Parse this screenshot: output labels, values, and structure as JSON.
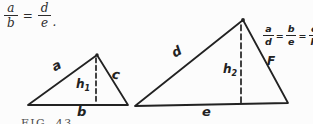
{
  "colors": {
    "ink": "#222222",
    "paper": "#fcfcfc"
  },
  "printed_equation": {
    "num1": "a",
    "den1": "b",
    "eq": "=",
    "num2": "d",
    "den2": "e",
    "period": "."
  },
  "handwritten_equation": {
    "num1": "a",
    "den1": "d",
    "eq1": "=",
    "num2": "b",
    "den2": "e",
    "eq2": "=",
    "num3": "c",
    "den3": "F"
  },
  "left_triangle": {
    "side_left": "a",
    "side_right": "c",
    "height_base": "h",
    "height_sub": "1",
    "base": "b"
  },
  "right_triangle": {
    "side_left": "d",
    "side_right": "F",
    "height_base": "h",
    "height_sub": "2",
    "base": "e"
  },
  "caption": "FIG. 43"
}
